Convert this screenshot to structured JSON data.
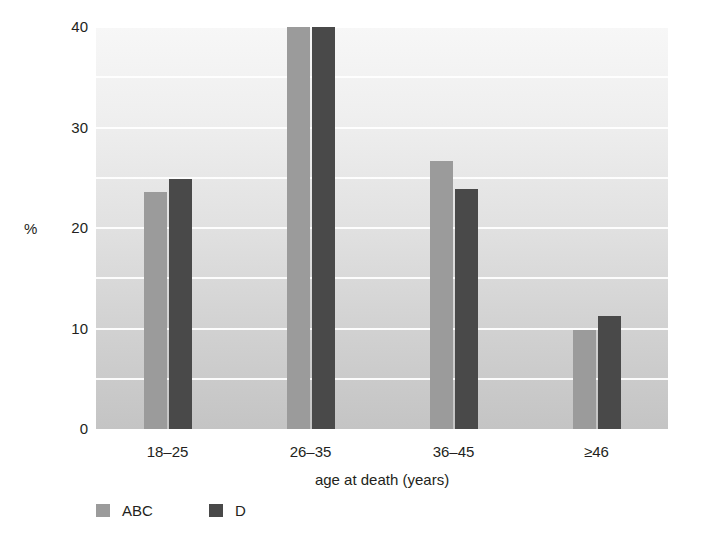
{
  "chart_data": {
    "type": "bar",
    "title": "",
    "subtitle": "",
    "xlabel": "age at death (years)",
    "ylabel": "%",
    "categories": [
      "18–25",
      "26–35",
      "36–45",
      "≥46"
    ],
    "series": [
      {
        "name": "ABC",
        "color": "#9b9b9b",
        "values": [
          23.6,
          40.0,
          26.7,
          9.9
        ]
      },
      {
        "name": "D",
        "color": "#494949",
        "values": [
          24.9,
          40.0,
          23.9,
          11.2
        ]
      }
    ],
    "ylim": [
      0,
      40
    ],
    "yticks": [
      0,
      10,
      20,
      30,
      40
    ],
    "ytick_labels": [
      "0",
      "10",
      "20",
      "30",
      "40"
    ],
    "minor_ytick_step": 5,
    "grid": true,
    "grid_color": "#ffffff",
    "grid_orientation": "horizontal",
    "legend_position": "bottom-left",
    "legend": [
      {
        "label": "ABC",
        "color": "#9b9b9b"
      },
      {
        "label": "D",
        "color": "#494949"
      }
    ],
    "plot_background": "vertical-gradient-light-gray",
    "axis_line": "none"
  }
}
